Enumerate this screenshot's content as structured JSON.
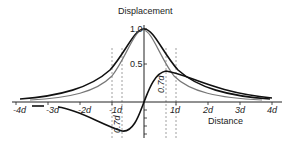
{
  "diagram": {
    "y_axis_label": "Displacement",
    "x_axis_label": "Distance",
    "y_ticks": [
      {
        "label": "1.0",
        "value": 1.0
      },
      {
        "label": "0.5",
        "value": 0.5
      }
    ],
    "x_ticks": [
      {
        "label": "-4d",
        "value": -4
      },
      {
        "label": "-3d",
        "value": -3
      },
      {
        "label": "-2d",
        "value": -2
      },
      {
        "label": "-1d",
        "value": -1
      },
      {
        "label": "1d",
        "value": 1
      },
      {
        "label": "2d",
        "value": 2
      },
      {
        "label": "3d",
        "value": 3
      },
      {
        "label": "4d",
        "value": 4
      }
    ],
    "annotations": [
      {
        "label": "0.7d",
        "position": "left-minimum"
      },
      {
        "label": "0.7d",
        "position": "right-maximum"
      }
    ],
    "curves": [
      {
        "name": "wide-bell",
        "color": "#111111"
      },
      {
        "name": "narrow-bell",
        "color": "#777777"
      },
      {
        "name": "antisymmetric",
        "color": "#111111"
      }
    ]
  }
}
